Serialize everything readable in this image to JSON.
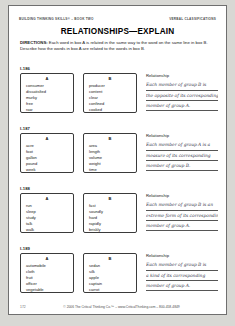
{
  "header": {
    "left": "Building Thinking Skills® – Book Two",
    "right": "Verbal Classifications"
  },
  "title": "RELATIONSHIPS—EXPLAIN",
  "directions": {
    "label": "DIRECTIONS:",
    "text": " Each word in box A is related in the same way to the word on the same line in box B. Describe how the words in box A are related to the words in box B."
  },
  "relationship_label": "Relationship",
  "exercises": [
    {
      "number": "I-186",
      "box_a_label": "A",
      "box_b_label": "B",
      "box_a": [
        "consumer",
        "dissatisfied",
        "murky",
        "free",
        "raw"
      ],
      "box_b": [
        "producer",
        "content",
        "clear",
        "confined",
        "cooked"
      ],
      "answer_lines": [
        "Each member of group B is",
        "the opposite of its corresponding",
        "member of group A."
      ]
    },
    {
      "number": "I-187",
      "box_a_label": "A",
      "box_b_label": "B",
      "box_a": [
        "acre",
        "foot",
        "gallon",
        "pound",
        "week"
      ],
      "box_b": [
        "area",
        "length",
        "volume",
        "weight",
        "time"
      ],
      "answer_lines": [
        "Each member of group A is a",
        "measure of its corresponding",
        "member of group B."
      ]
    },
    {
      "number": "I-188",
      "box_a_label": "A",
      "box_b_label": "B",
      "box_a": [
        "run",
        "sleep",
        "study",
        "talk",
        "walk"
      ],
      "box_b": [
        "fast",
        "soundly",
        "hard",
        "rapidly",
        "briskly"
      ],
      "answer_lines": [
        "Each member of group B is an",
        "extreme form of its corresponding",
        "member of group A."
      ]
    },
    {
      "number": "I-189",
      "box_a_label": "A",
      "box_b_label": "B",
      "box_a": [
        "automobile",
        "cloth",
        "fruit",
        "officer",
        "vegetable"
      ],
      "box_b": [
        "sedan",
        "silk",
        "apple",
        "captain",
        "carrot"
      ],
      "answer_lines": [
        "Each member of group B is",
        "a kind of its corresponding",
        "member of group A."
      ]
    }
  ],
  "footer": {
    "page_number": "172",
    "copyright": "© 2006 The Critical Thinking Co.™ – www.CriticalThinking.com – 800-458-4849"
  }
}
